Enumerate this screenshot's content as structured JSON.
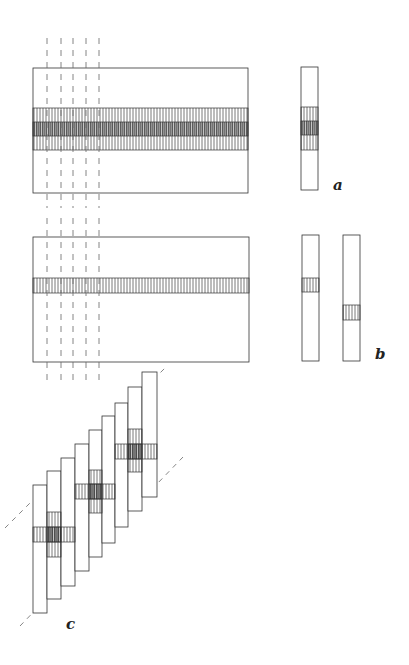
{
  "labels": {
    "a": "a",
    "b": "b",
    "c": "c"
  },
  "colors": {
    "stroke": "#333333",
    "hatch": "#555555",
    "hatch_dark": "#2a2a2a",
    "dash": "#666666",
    "background": "#ffffff"
  },
  "panels": {
    "a": {
      "main_rect": {
        "x": 33,
        "y": 68,
        "w": 215,
        "h": 125
      },
      "outer_band": {
        "y": 108,
        "h": 42
      },
      "inner_band": {
        "y": 122,
        "h": 14
      },
      "strip": {
        "x": 301,
        "y": 67,
        "w": 17,
        "h": 123,
        "band_y": 107,
        "band_h": 43,
        "inner_y": 121,
        "inner_h": 14
      }
    },
    "b": {
      "main_rect": {
        "x": 33,
        "y": 237,
        "w": 216,
        "h": 125
      },
      "band": {
        "y": 278,
        "h": 15
      },
      "strips": [
        {
          "x": 302,
          "y": 235,
          "w": 17,
          "h": 126,
          "band_y": 278,
          "band_h": 14
        },
        {
          "x": 343,
          "y": 235,
          "w": 17,
          "h": 126,
          "band_y": 305,
          "band_h": 15
        }
      ]
    },
    "c": {
      "strips": [
        {
          "x": 33,
          "y": 485,
          "bottom": 613
        },
        {
          "x": 47,
          "y": 471,
          "bottom": 599
        },
        {
          "x": 61,
          "y": 458,
          "bottom": 586
        },
        {
          "x": 75,
          "y": 444,
          "bottom": 571
        },
        {
          "x": 89,
          "y": 430,
          "bottom": 557
        },
        {
          "x": 102,
          "y": 416,
          "bottom": 543
        },
        {
          "x": 115,
          "y": 403,
          "bottom": 527
        },
        {
          "x": 128,
          "y": 387,
          "bottom": 511
        },
        {
          "x": 142,
          "y": 372,
          "bottom": 497
        }
      ],
      "crosses": [
        {
          "hx1": 33,
          "hx2": 75,
          "hy": 527,
          "hh": 15,
          "vx": 47,
          "vw": 14,
          "vy": 512,
          "vh": 45
        },
        {
          "hx1": 75,
          "hx2": 115,
          "hy": 484,
          "hh": 15,
          "vx": 89,
          "vw": 13,
          "vy": 470,
          "vh": 43
        },
        {
          "hx1": 115,
          "hx2": 157,
          "hy": 444,
          "hh": 15,
          "vx": 128,
          "vw": 14,
          "vy": 429,
          "vh": 43
        }
      ],
      "diagonals": [
        {
          "x1": 5,
          "y1": 528,
          "x2": 166,
          "y2": 367
        },
        {
          "x1": 20,
          "y1": 626,
          "x2": 183,
          "y2": 457
        }
      ]
    },
    "verticals": {
      "x": [
        47,
        61,
        73,
        86,
        99
      ],
      "segments": [
        {
          "y1": 38,
          "y2": 208
        },
        {
          "y1": 218,
          "y2": 382
        }
      ]
    }
  }
}
